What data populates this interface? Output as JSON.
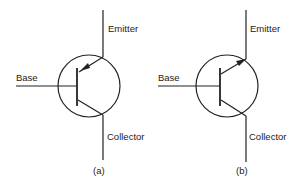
{
  "diagram": {
    "figures": [
      {
        "caption": "(a)",
        "type": "PNP",
        "labels": {
          "emitter": "Emitter",
          "base": "Base",
          "collector": "Collector"
        }
      },
      {
        "caption": "(b)",
        "type": "NPN",
        "labels": {
          "emitter": "Emitter",
          "base": "Base",
          "collector": "Collector"
        }
      }
    ],
    "colors": {
      "stroke": "#222222",
      "background": "#ffffff"
    }
  }
}
